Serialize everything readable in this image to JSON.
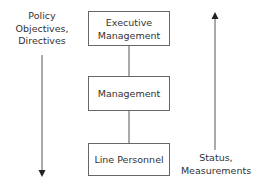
{
  "diagram": {
    "nodes": [
      {
        "id": "executive",
        "label_line1": "Executive",
        "label_line2": "Management"
      },
      {
        "id": "management",
        "label": "Management"
      },
      {
        "id": "line_personnel",
        "label": "Line Personnel"
      }
    ],
    "edges": [
      {
        "from": "executive",
        "to": "management"
      },
      {
        "from": "management",
        "to": "line_personnel"
      }
    ],
    "left_arrow": {
      "direction": "down",
      "line1": "Policy",
      "line2": "Objectives,",
      "line3": "Directives"
    },
    "right_arrow": {
      "direction": "up",
      "line1": "Status,",
      "line2": "Measurements"
    },
    "colors": {
      "line": "#555555",
      "text": "#333333",
      "box_border": "#666666"
    }
  }
}
